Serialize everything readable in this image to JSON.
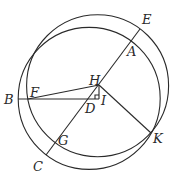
{
  "diagram": {
    "title": "",
    "colors": {
      "stroke": "#2a2a2a",
      "background": "#ffffff"
    },
    "circles": [
      {
        "name": "circle-EFGK",
        "cx": 97.6,
        "cy": 85.7,
        "r": 71
      },
      {
        "name": "circle-BACK",
        "cx": 89.2,
        "cy": 98.4,
        "r": 71
      }
    ],
    "points": {
      "E": {
        "x": 140,
        "y": 29
      },
      "A": {
        "x": 131,
        "y": 41
      },
      "H": {
        "x": 99,
        "y": 85
      },
      "B": {
        "x": 18,
        "y": 99
      },
      "F": {
        "x": 28,
        "y": 99
      },
      "D": {
        "x": 88,
        "y": 99
      },
      "I": {
        "x": 99,
        "y": 99
      },
      "G": {
        "x": 56,
        "y": 143
      },
      "K": {
        "x": 151,
        "y": 133
      },
      "C": {
        "x": 46,
        "y": 155
      }
    },
    "segments": [
      "EC",
      "BI",
      "HI",
      "HF",
      "HK"
    ],
    "labels": {
      "E": "E",
      "A": "A",
      "H": "H",
      "B": "B",
      "F": "F",
      "D": "D",
      "I": "I",
      "G": "G",
      "K": "K",
      "C": "C"
    }
  }
}
